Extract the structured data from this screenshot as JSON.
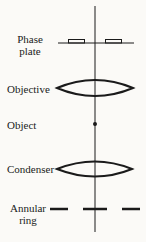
{
  "diagram": {
    "type": "optical path schematic",
    "components": [
      {
        "id": "phase-plate",
        "label_line1": "Phase",
        "label_line2": "plate"
      },
      {
        "id": "objective",
        "label": "Objective"
      },
      {
        "id": "object",
        "label": "Object"
      },
      {
        "id": "condenser",
        "label": "Condenser"
      },
      {
        "id": "annular-ring",
        "label_line1": "Annular",
        "label_line2": "ring"
      }
    ],
    "colors": {
      "ink": "#1a1a1a",
      "background": "#fbfaf7"
    }
  }
}
